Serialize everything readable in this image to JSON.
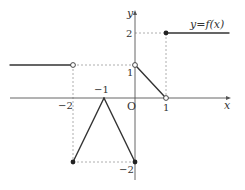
{
  "graph": {
    "function_label": "y=f(x)",
    "axis_labels": {
      "x": "x",
      "y": "y",
      "origin": "O"
    },
    "tick_labels": {
      "x_neg2": "−2",
      "x_neg1": "−1",
      "x_1": "1",
      "y_2": "2",
      "y_1": "1",
      "y_neg2": "−2"
    },
    "colors": {
      "line": "#333333",
      "axis": "#555555",
      "guide": "#999999"
    },
    "pieces": [
      {
        "domain": "x < -2",
        "value": "1",
        "endpoint_at_-2": "open"
      },
      {
        "domain": "-2 <= x <= -1",
        "from": [
          -2,
          -2
        ],
        "to": [
          -1,
          0
        ]
      },
      {
        "domain": "-1 <= x <= 0",
        "from": [
          -1,
          0
        ],
        "to": [
          0,
          -2
        ]
      },
      {
        "domain": "0 < x < 1",
        "from": [
          0,
          1
        ],
        "to": [
          1,
          0
        ],
        "endpoints": "open"
      },
      {
        "domain": "x >= 1",
        "value": "2",
        "endpoint_at_1": "closed"
      }
    ],
    "points": [
      {
        "x": -2,
        "y": 1,
        "type": "open"
      },
      {
        "x": -2,
        "y": -2,
        "type": "closed"
      },
      {
        "x": 0,
        "y": -2,
        "type": "closed"
      },
      {
        "x": 0,
        "y": 1,
        "type": "open"
      },
      {
        "x": 1,
        "y": 0,
        "type": "open"
      },
      {
        "x": 1,
        "y": 2,
        "type": "closed"
      }
    ]
  }
}
